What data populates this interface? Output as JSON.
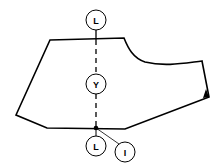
{
  "diagram": {
    "type": "pattern-piece",
    "colors": {
      "stroke": "#000000",
      "background": "#ffffff"
    },
    "labels": {
      "top_circle": "L",
      "middle_circle": "Y",
      "bottom_left_circle": "L",
      "bottom_right_circle": "I"
    }
  }
}
